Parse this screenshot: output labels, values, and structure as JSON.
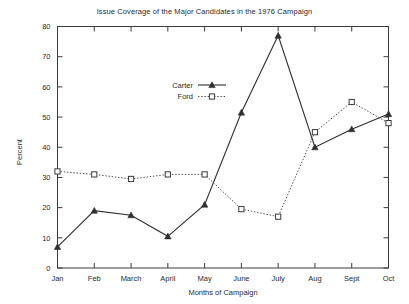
{
  "chart_data": {
    "type": "line",
    "title": "Issue Coverage of the Major Candidates in the 1976 Campaign",
    "xlabel": "Months of Campaign",
    "ylabel": "Percent",
    "categories": [
      "Jan",
      "Feb",
      "March",
      "April",
      "May",
      "June",
      "July",
      "Aug",
      "Sept",
      "Oct"
    ],
    "xtick_labels": [
      "Jan",
      "Feb",
      "March",
      "April",
      "May",
      "June",
      "July",
      "Aug",
      "Sept",
      "Oct"
    ],
    "ytick_labels": [
      "0",
      "10",
      "20",
      "30",
      "40",
      "50",
      "60",
      "70",
      "80"
    ],
    "yticks": [
      0,
      10,
      20,
      30,
      40,
      50,
      60,
      70,
      80
    ],
    "ylim": [
      0,
      80
    ],
    "grid": false,
    "legend_position": "upper-left-inside",
    "series": [
      {
        "name": "Carter",
        "marker": "triangle",
        "line_style": "solid",
        "color": "#2f2f2f",
        "values": [
          7,
          19,
          17.5,
          10.5,
          21,
          51.5,
          77,
          40,
          46,
          51
        ]
      },
      {
        "name": "Ford",
        "marker": "square-open",
        "line_style": "dotted",
        "color": "#4a4a4a",
        "values": [
          32,
          31,
          29.5,
          31,
          31,
          19.5,
          17,
          45,
          55,
          48
        ]
      }
    ]
  },
  "legend": {
    "entries": [
      {
        "label": "Carter"
      },
      {
        "label": "Ford"
      }
    ]
  },
  "colors": {
    "background": "#ffffff",
    "axis": "#3a3a3a",
    "text": "#2b2b2b",
    "carter": "#2f2f2f",
    "ford": "#4a4a4a"
  }
}
